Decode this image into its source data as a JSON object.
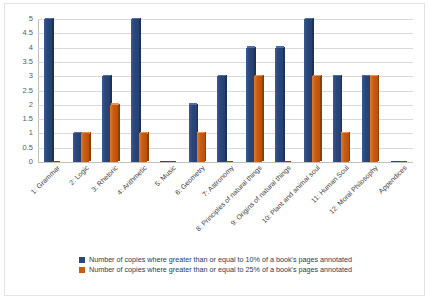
{
  "chart_data": {
    "type": "bar",
    "title": "",
    "xlabel": "",
    "ylabel": "",
    "ylim": [
      0,
      5
    ],
    "yticks": [
      "0",
      "0.5",
      "1",
      "1.5",
      "2",
      "2.5",
      "3",
      "3.5",
      "4",
      "4.5",
      "5"
    ],
    "grid": true,
    "legend_position": "bottom",
    "categories": [
      "1: Grammar",
      "2: Logic",
      "3: Rhetoric",
      "4: Arithmetic",
      "5: Music",
      "6: Geometry",
      "7: Astronomy",
      "8: Principles of natural things",
      "9: Origins of natural things",
      "10: Plant and animal soul",
      "11: Human Soul",
      "12: Moral Philosophy",
      "Appendices"
    ],
    "series": [
      {
        "name": "Number of copies where greater than or equal to 10% of a book's pages annotated",
        "color": "#2b4678",
        "values": [
          5,
          1,
          3,
          5,
          0,
          2,
          3,
          4,
          4,
          5,
          3,
          3,
          0
        ]
      },
      {
        "name": "Number of copies where greater than or equal to 25% of a book's pages annotated",
        "color": "#c75c12",
        "values": [
          0,
          1,
          2,
          1,
          0,
          1,
          0,
          3,
          0,
          3,
          1,
          3,
          0
        ]
      }
    ]
  }
}
